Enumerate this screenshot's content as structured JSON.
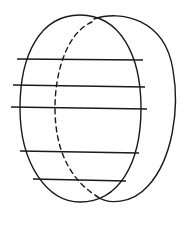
{
  "figure": {
    "components": [
      {
        "name": "front-oval",
        "style": "solid"
      },
      {
        "name": "back-oval",
        "style": "solid"
      },
      {
        "name": "hidden-edge",
        "style": "dashed"
      }
    ],
    "horizontal_line_count": 5,
    "stroke_color": "#1a1a1a",
    "background_color": "#ffffff"
  }
}
